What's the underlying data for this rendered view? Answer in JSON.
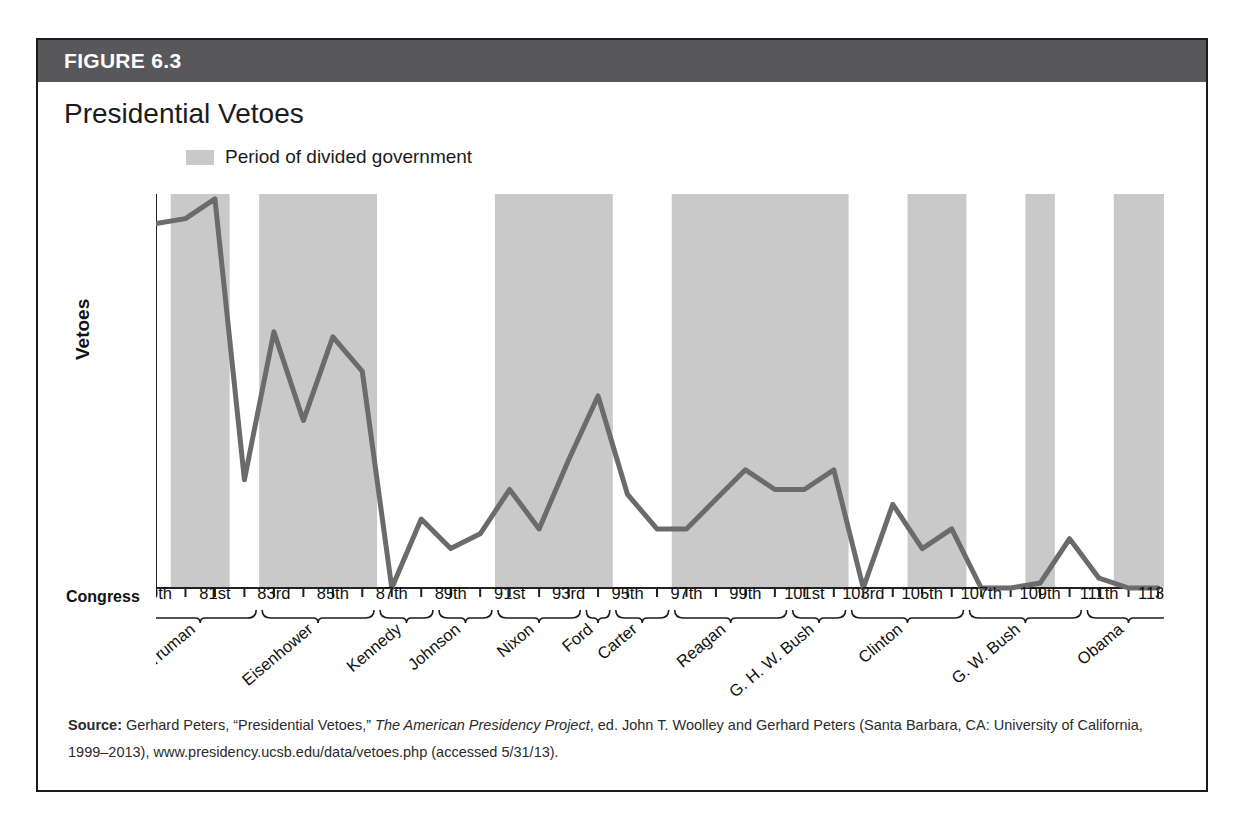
{
  "figure": {
    "label": "FIGURE 6.3",
    "title": "Presidential Vetoes",
    "header_color": "#58585a",
    "band_color": "#c9c9c9",
    "line_color": "#6b6b6b"
  },
  "legend": {
    "items": [
      {
        "label": "Period of divided government",
        "swatch_color": "#c9c9c9",
        "icon": "shaded-band-swatch"
      }
    ]
  },
  "axis": {
    "y_title": "Vetoes",
    "y_ticks": [
      "0",
      "20",
      "40",
      "60",
      "80"
    ],
    "x_row_label": "Congress"
  },
  "source": {
    "prefix": "Source:",
    "part1": " Gerhard Peters, “Presidential Vetoes,” ",
    "italic": "The American Presidency Project",
    "part2": ", ed. John T. Woolley and Gerhard Peters (Santa Barbara, CA: University of California, 1999–2013), www.presidency.ucsb.edu/data/vetoes.php (accessed 5/31/13)."
  },
  "chart_data": {
    "type": "line",
    "title": "Presidential Vetoes",
    "xlabel": "Congress",
    "ylabel": "Vetoes",
    "ylim": [
      0,
      80
    ],
    "yticks": [
      0,
      20,
      40,
      60,
      80
    ],
    "grid": false,
    "legend_position": "top-left",
    "categories": [
      "79th",
      "80th",
      "81st",
      "82nd",
      "83rd",
      "84th",
      "85th",
      "86th",
      "87th",
      "88th",
      "89th",
      "90th",
      "91st",
      "92nd",
      "93rd",
      "94th",
      "95th",
      "96th",
      "97th",
      "98th",
      "99th",
      "100th",
      "101st",
      "102nd",
      "103rd",
      "104th",
      "105th",
      "106th",
      "107th",
      "108th",
      "109th",
      "110th",
      "111th",
      "112th",
      "113th"
    ],
    "tick_labels_shown": [
      "79th",
      "81st",
      "83rd",
      "85th",
      "87th",
      "89th",
      "91st",
      "93rd",
      "95th",
      "97th",
      "99th",
      "101st",
      "103rd",
      "105th",
      "107th",
      "109th",
      "111th",
      "113th"
    ],
    "values": [
      74,
      75,
      79,
      22,
      52,
      34,
      51,
      44,
      0,
      14,
      8,
      11,
      20,
      12,
      26,
      39,
      19,
      12,
      12,
      18,
      24,
      20,
      20,
      24,
      0,
      17,
      8,
      12,
      0,
      0,
      1,
      10,
      2,
      0,
      0
    ],
    "series": [
      {
        "name": "Vetoes",
        "color": "#6b6b6b",
        "values": [
          74,
          75,
          79,
          22,
          52,
          34,
          51,
          44,
          0,
          14,
          8,
          11,
          20,
          12,
          26,
          39,
          19,
          12,
          12,
          18,
          24,
          20,
          20,
          24,
          0,
          17,
          8,
          12,
          0,
          0,
          1,
          10,
          2,
          0,
          0
        ]
      }
    ],
    "presidents": [
      {
        "name": "Truman",
        "start_index": 0,
        "end_index": 3
      },
      {
        "name": "Eisenhower",
        "start_index": 4,
        "end_index": 7
      },
      {
        "name": "Kennedy",
        "start_index": 8,
        "end_index": 9
      },
      {
        "name": "Johnson",
        "start_index": 10,
        "end_index": 11
      },
      {
        "name": "Nixon",
        "start_index": 12,
        "end_index": 14
      },
      {
        "name": "Ford",
        "start_index": 15,
        "end_index": 15
      },
      {
        "name": "Carter",
        "start_index": 16,
        "end_index": 17
      },
      {
        "name": "Reagan",
        "start_index": 18,
        "end_index": 21
      },
      {
        "name": "G. H. W. Bush",
        "start_index": 22,
        "end_index": 23
      },
      {
        "name": "Clinton",
        "start_index": 24,
        "end_index": 27
      },
      {
        "name": "G. W. Bush",
        "start_index": 28,
        "end_index": 31
      },
      {
        "name": "Obama",
        "start_index": 32,
        "end_index": 34
      }
    ],
    "divided_government_bands": [
      {
        "start_index": 1,
        "end_index": 2,
        "label": "80th–81st"
      },
      {
        "start_index": 4,
        "end_index": 7,
        "label": "83rd–86th"
      },
      {
        "start_index": 12,
        "end_index": 15,
        "label": "91st–94th"
      },
      {
        "start_index": 18,
        "end_index": 23,
        "label": "97th–102nd"
      },
      {
        "start_index": 26,
        "end_index": 27,
        "label": "105th–106th"
      },
      {
        "start_index": 30,
        "end_index": 30,
        "label": "109th"
      },
      {
        "start_index": 33,
        "end_index": 34,
        "label": "112th–113th"
      }
    ]
  }
}
